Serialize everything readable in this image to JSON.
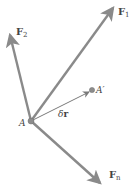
{
  "diagram": {
    "type": "force-vector-diagram",
    "colors": {
      "arrow": "#8a8a8a",
      "displacement_arrow": "#7a7a7a",
      "point": "#8c8c8c",
      "label": "#444444"
    },
    "point_A": {
      "label": "A",
      "x": 31,
      "y": 121
    },
    "point_A_prime": {
      "label": "A′",
      "x": 92,
      "y": 90
    },
    "displacement": {
      "label": "δr",
      "symbol": "δ",
      "vector": "r"
    },
    "forces": [
      {
        "id": "F1",
        "label": "F",
        "subscript": "1",
        "to": [
          115,
          5
        ]
      },
      {
        "id": "F2",
        "label": "F",
        "subscript": "2",
        "to": [
          9,
          32
        ]
      },
      {
        "id": "Fn",
        "label": "F",
        "subscript": "n",
        "to": [
          102,
          185
        ]
      }
    ]
  }
}
